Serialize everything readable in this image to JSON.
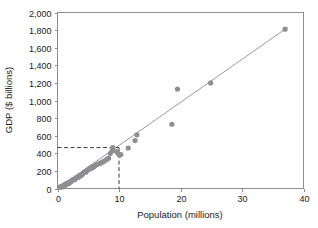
{
  "chart_data": {
    "type": "scatter",
    "title": "",
    "xlabel": "Population (millions)",
    "ylabel": "GDP ($ billions)",
    "xlim": [
      0,
      40
    ],
    "ylim": [
      0,
      2000
    ],
    "xticks": [
      "0",
      "10",
      "20",
      "30",
      "40"
    ],
    "xtick_values": [
      0,
      10,
      20,
      30,
      40
    ],
    "yticks": [
      "0",
      "200",
      "400",
      "600",
      "800",
      "1,000",
      "1,200",
      "1,400",
      "1,600",
      "1,800",
      "2,000"
    ],
    "ytick_values": [
      0,
      200,
      400,
      600,
      800,
      1000,
      1200,
      1400,
      1600,
      1800,
      2000
    ],
    "grid": false,
    "legend": null,
    "marker_color": "#8e8e93",
    "trendline_color": "#9a9a9a",
    "reference_line_color": "#3a3a3a",
    "series": [
      {
        "name": "Countries",
        "points": [
          [
            0.4,
            15
          ],
          [
            0.6,
            20
          ],
          [
            0.7,
            25
          ],
          [
            0.8,
            18
          ],
          [
            0.9,
            30
          ],
          [
            1.0,
            35
          ],
          [
            1.1,
            28
          ],
          [
            1.2,
            45
          ],
          [
            1.3,
            40
          ],
          [
            1.4,
            55
          ],
          [
            1.6,
            50
          ],
          [
            1.7,
            65
          ],
          [
            1.9,
            60
          ],
          [
            2.0,
            75
          ],
          [
            2.2,
            80
          ],
          [
            2.4,
            95
          ],
          [
            2.6,
            105
          ],
          [
            2.8,
            100
          ],
          [
            3.0,
            120
          ],
          [
            3.2,
            130
          ],
          [
            3.4,
            125
          ],
          [
            3.6,
            150
          ],
          [
            3.8,
            145
          ],
          [
            4.0,
            160
          ],
          [
            4.2,
            175
          ],
          [
            4.4,
            190
          ],
          [
            4.6,
            185
          ],
          [
            4.8,
            205
          ],
          [
            5.0,
            215
          ],
          [
            5.2,
            230
          ],
          [
            5.4,
            225
          ],
          [
            5.6,
            245
          ],
          [
            5.8,
            240
          ],
          [
            6.0,
            255
          ],
          [
            6.2,
            265
          ],
          [
            6.5,
            275
          ],
          [
            6.8,
            285
          ],
          [
            7.0,
            290
          ],
          [
            7.3,
            300
          ],
          [
            7.6,
            310
          ],
          [
            8.0,
            330
          ],
          [
            8.3,
            345
          ],
          [
            8.6,
            400
          ],
          [
            8.9,
            430
          ],
          [
            9.0,
            465
          ],
          [
            9.6,
            420
          ],
          [
            9.9,
            395
          ],
          [
            10.1,
            380
          ],
          [
            10.3,
            385
          ],
          [
            11.5,
            460
          ],
          [
            12.6,
            545
          ],
          [
            12.9,
            610
          ],
          [
            18.6,
            730
          ],
          [
            19.5,
            1130
          ],
          [
            24.9,
            1200
          ],
          [
            37.0,
            1810
          ]
        ]
      }
    ],
    "trendline": {
      "x_start": 0.0,
      "y_start": 0,
      "x_end": 37.4,
      "y_end": 1830
    },
    "reference_lines": {
      "horizontal_y": 465,
      "vertical_x": 10.0
    }
  }
}
